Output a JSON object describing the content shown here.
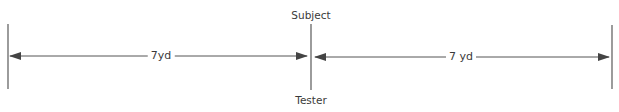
{
  "diagram": {
    "top_label": "Subject",
    "bottom_label": "Tester",
    "left_distance": "7yd",
    "right_distance": "7 yd",
    "line_color": "#555555",
    "text_color": "#3a3a3a"
  }
}
